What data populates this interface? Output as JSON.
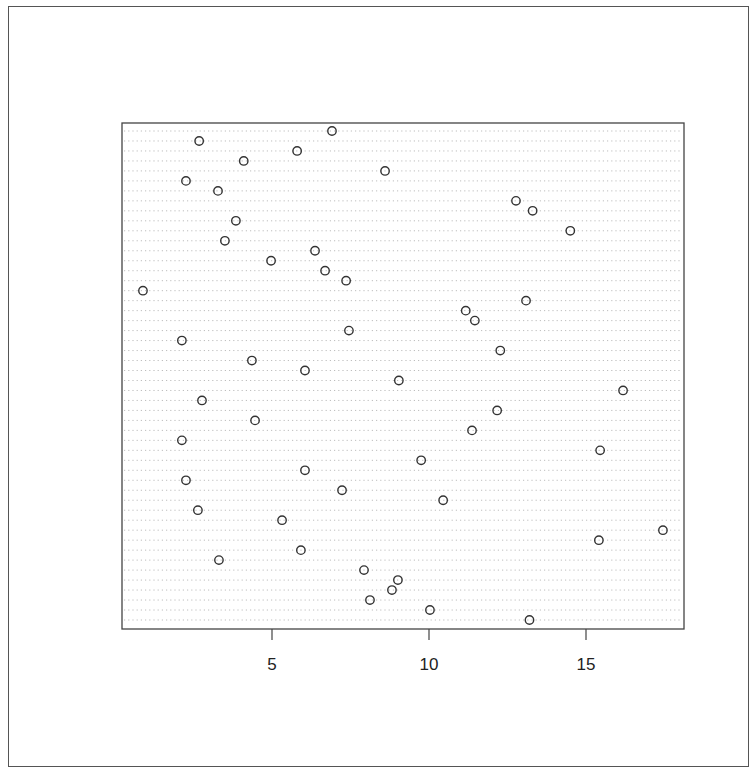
{
  "chart_data": {
    "type": "scatter",
    "subtype": "dotchart",
    "title": "",
    "xlabel": "",
    "ylabel": "",
    "xlim": [
      0.3,
      18.0
    ],
    "x_ticks": [
      5,
      10,
      15
    ],
    "x_tick_labels": [
      "5",
      "10",
      "15"
    ],
    "y_tick_labels": [],
    "grid": "horizontal dotted lines, one per row",
    "legend": null,
    "n_rows": 50,
    "values": [
      6.91,
      2.68,
      5.8,
      4.1,
      8.6,
      2.26,
      3.28,
      12.77,
      13.3,
      3.85,
      14.5,
      3.5,
      6.37,
      4.97,
      6.69,
      7.36,
      0.89,
      13.09,
      11.17,
      11.46,
      7.45,
      2.13,
      12.27,
      4.36,
      6.05,
      9.04,
      16.18,
      2.77,
      12.17,
      4.46,
      11.37,
      2.13,
      15.45,
      9.75,
      6.05,
      2.26,
      7.23,
      10.45,
      2.64,
      5.32,
      17.45,
      15.41,
      5.92,
      3.31,
      7.93,
      9.01,
      8.82,
      8.12,
      10.03,
      13.2
    ],
    "marker": "open-circle",
    "colors": {
      "marker_stroke": "#333333",
      "grid": "#bdbdbd",
      "axis": "#444444",
      "frame": "#555555"
    }
  }
}
